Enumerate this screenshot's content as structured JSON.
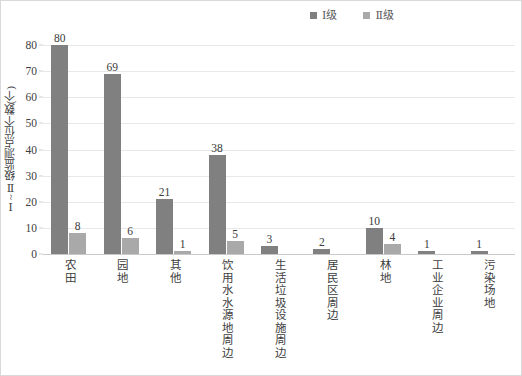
{
  "chart_data": {
    "type": "bar",
    "title": "",
    "subtitle": "",
    "xlabel": "",
    "ylabel": "Ⅰ~Ⅱ级监测点位个数(个)",
    "ylim": [
      0,
      80
    ],
    "ytick_labels": [
      "80",
      "70",
      "60",
      "50",
      "40",
      "30",
      "20",
      "10",
      "0"
    ],
    "ytick_values": [
      80,
      70,
      60,
      50,
      40,
      30,
      20,
      10,
      0
    ],
    "grid": "horizontal",
    "legend_position": "top-center-right",
    "categories": [
      "农田",
      "园地",
      "其他",
      "饮用水水源地周边",
      "生活垃圾设施周边",
      "居民区周边",
      "林地",
      "工业企业周边",
      "污染场地"
    ],
    "series": [
      {
        "name": "Ⅰ级",
        "color": "#808080",
        "values": [
          80,
          69,
          21,
          38,
          3,
          2,
          10,
          1,
          1
        ],
        "labels": [
          "80",
          "69",
          "21",
          "38",
          "3",
          "2",
          "10",
          "1",
          "1"
        ]
      },
      {
        "name": "Ⅱ级",
        "color": "#a9a9a9",
        "values": [
          8,
          6,
          1,
          5,
          0,
          0,
          4,
          0,
          0
        ],
        "labels": [
          "8",
          "6",
          "1",
          "5",
          "",
          "",
          "4",
          "",
          ""
        ]
      }
    ]
  },
  "legend": {
    "items": [
      {
        "label": "Ⅰ级",
        "color": "#808080"
      },
      {
        "label": "Ⅱ级",
        "color": "#a9a9a9"
      }
    ]
  },
  "colors": {
    "series_1": "#808080",
    "series_2": "#a9a9a9",
    "gridline": "#e8e8e8",
    "axis": "#c9c9c9",
    "border": "#d9d9d9",
    "text": "#404040"
  }
}
